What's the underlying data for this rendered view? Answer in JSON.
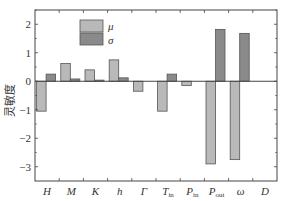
{
  "chart_data": {
    "type": "bar",
    "title": "",
    "xlabel": "",
    "ylabel": "灵敏度",
    "ylim": [
      -3.5,
      2.5
    ],
    "yticks": [
      -3,
      -2,
      -1,
      0,
      1,
      2
    ],
    "grid": false,
    "legend_position": "upper-left-inside",
    "categories": [
      {
        "main": "H",
        "sub": ""
      },
      {
        "main": "M",
        "sub": ""
      },
      {
        "main": "K",
        "sub": ""
      },
      {
        "main": "h",
        "sub": ""
      },
      {
        "main": "Γ",
        "sub": ""
      },
      {
        "main": "T",
        "sub": "in"
      },
      {
        "main": "P",
        "sub": "in"
      },
      {
        "main": "P",
        "sub": "out"
      },
      {
        "main": "ω",
        "sub": ""
      },
      {
        "main": "D",
        "sub": ""
      }
    ],
    "series": [
      {
        "name": "μ",
        "color": "#b9b9b9",
        "values": [
          -1.05,
          0.62,
          0.4,
          0.75,
          -0.35,
          -1.05,
          -0.15,
          -2.9,
          -2.75,
          0.0
        ]
      },
      {
        "name": "σ",
        "color": "#8a8a8a",
        "values": [
          0.25,
          0.08,
          0.04,
          0.12,
          0.0,
          0.25,
          0.0,
          1.82,
          1.68,
          0.0
        ]
      }
    ]
  },
  "legend": {
    "mu_label": "μ",
    "sigma_label": "σ"
  },
  "axis": {
    "ylabel": "灵敏度"
  }
}
